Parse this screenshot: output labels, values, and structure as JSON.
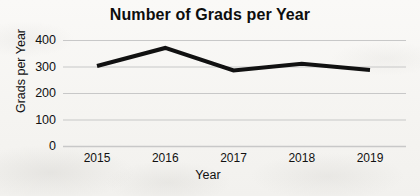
{
  "chart_data": {
    "type": "line",
    "title": "Number of Grads per Year",
    "xlabel": "Year",
    "ylabel": "Grads per Year",
    "categories": [
      "2015",
      "2016",
      "2017",
      "2018",
      "2019"
    ],
    "x": [
      2015,
      2016,
      2017,
      2018,
      2019
    ],
    "values": [
      302,
      370,
      285,
      310,
      287
    ],
    "series": [
      {
        "name": "Grads per Year",
        "values": [
          302,
          370,
          285,
          310,
          287
        ],
        "color": "#111111",
        "line_width": 4
      }
    ],
    "ylim": [
      0,
      400
    ],
    "xlim": [
      2015,
      2019
    ],
    "y_ticks": [
      0,
      100,
      200,
      300,
      400
    ],
    "y_tick_labels": [
      "0",
      "100",
      "200",
      "300",
      "400"
    ],
    "x_tick_labels": [
      "2015",
      "2016",
      "2017",
      "2018",
      "2019"
    ],
    "grid": true,
    "grid_axis": "y",
    "grid_color": "#c8c8c8",
    "legend": false,
    "legend_position": "none",
    "markers": false,
    "background_color": "#f7f6f4"
  }
}
